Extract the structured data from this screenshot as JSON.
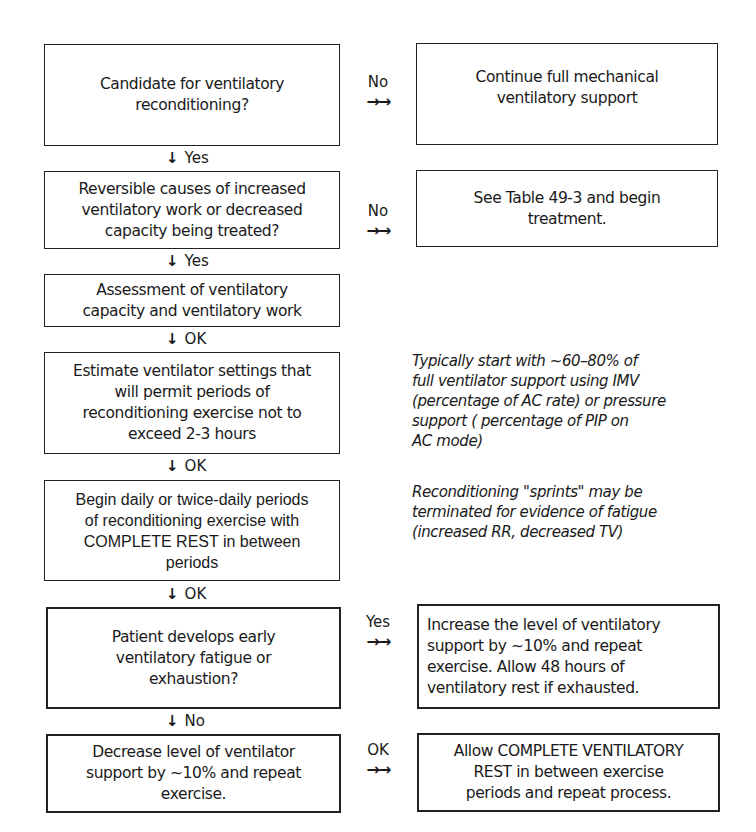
{
  "flowchart": {
    "main_steps": [
      {
        "id": "candidate",
        "lines": [
          "Candidate for ventilatory",
          "reconditioning?"
        ]
      },
      {
        "id": "reversible",
        "lines": [
          "Reversible causes of increased",
          "ventilatory work or decreased",
          "capacity being treated?"
        ]
      },
      {
        "id": "assessment",
        "lines": [
          "Assessment of ventilatory",
          "capacity and ventilatory work"
        ]
      },
      {
        "id": "estimate",
        "lines": [
          "Estimate ventilator settings that",
          "will permit periods of",
          "reconditioning exercise not to",
          "exceed 2-3 hours"
        ]
      },
      {
        "id": "begin",
        "lines": [
          "Begin daily or twice-daily periods",
          "of reconditioning exercise with",
          "COMPLETE REST in between",
          "periods"
        ]
      },
      {
        "id": "fatigue",
        "lines": [
          "Patient develops early",
          "ventilatory fatigue or",
          "exhaustion?"
        ]
      },
      {
        "id": "decrease",
        "lines": [
          "Decrease level of ventilator",
          "support by ~10% and repeat",
          "exercise."
        ]
      }
    ],
    "down_connectors": [
      {
        "arrow": "↓",
        "label": "Yes"
      },
      {
        "arrow": "↓",
        "label": "Yes"
      },
      {
        "arrow": "↓",
        "label": "OK"
      },
      {
        "arrow": "↓",
        "label": "OK"
      },
      {
        "arrow": "↓",
        "label": "OK"
      },
      {
        "arrow": "↓",
        "label": "No"
      }
    ],
    "side_connectors": [
      {
        "label": "No",
        "arrow": "→→"
      },
      {
        "label": "No",
        "arrow": "→→"
      },
      {
        "label": "Yes",
        "arrow": "→→"
      },
      {
        "label": "OK",
        "arrow": "→→"
      }
    ],
    "side_outcomes": [
      {
        "id": "continue",
        "lines": [
          "Continue full mechanical",
          "ventilatory support"
        ]
      },
      {
        "id": "see-table",
        "lines": [
          "See Table 49-3 and begin",
          "treatment."
        ]
      },
      {
        "id": "increase",
        "lines": [
          "Increase the level of ventilatory",
          "support by ~10% and repeat",
          "exercise.  Allow 48 hours of",
          "ventilatory rest if exhausted."
        ]
      },
      {
        "id": "allow-rest",
        "lines": [
          "Allow COMPLETE VENTILATORY",
          "REST in between exercise",
          "periods and repeat process."
        ]
      }
    ],
    "notes": [
      {
        "id": "typical-start",
        "lines": [
          "Typically start with ~60–80% of",
          "full ventilator support using IMV",
          "(percentage of AC rate) or pressure",
          "support ( percentage of PIP on",
          "AC mode)"
        ]
      },
      {
        "id": "sprints",
        "lines": [
          "Reconditioning \"sprints\" may be",
          "terminated for evidence of fatigue",
          "(increased RR, decreased TV)"
        ]
      }
    ]
  }
}
